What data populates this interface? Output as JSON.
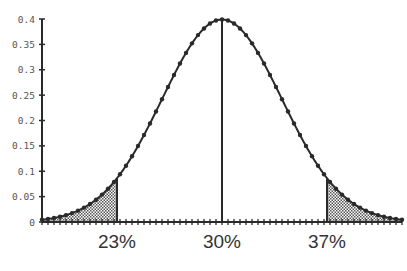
{
  "chart_data": {
    "type": "line",
    "title": "",
    "xlabel": "",
    "ylabel": "",
    "distribution": {
      "mean": 30,
      "sd": 4
    },
    "xlim": [
      18,
      42
    ],
    "ylim": [
      0,
      0.4
    ],
    "yticks": [
      0,
      0.05,
      0.1,
      0.15,
      0.2,
      0.25,
      0.3,
      0.35,
      0.4
    ],
    "ytick_labels": [
      "0",
      "0.05",
      "0.1",
      "0.15",
      "0.2",
      "0.25",
      "0.3",
      "0.35",
      "0.4"
    ],
    "xtick_step": 0.4,
    "xlabels": [
      {
        "x": 23,
        "label": "23%"
      },
      {
        "x": 30,
        "label": "30%"
      },
      {
        "x": 37,
        "label": "37%"
      }
    ],
    "marker_step": 0.4,
    "vertical_lines": [
      23,
      30,
      37
    ],
    "shaded_regions": [
      {
        "from": 18,
        "to": 23,
        "pattern": "dotted"
      },
      {
        "from": 37,
        "to": 42,
        "pattern": "dotted"
      }
    ],
    "sample_points": [
      {
        "x": 18,
        "y": 0.004
      },
      {
        "x": 20,
        "y": 0.018
      },
      {
        "x": 22,
        "y": 0.054
      },
      {
        "x": 23,
        "y": 0.086
      },
      {
        "x": 24,
        "y": 0.13
      },
      {
        "x": 26,
        "y": 0.242
      },
      {
        "x": 28,
        "y": 0.352
      },
      {
        "x": 30,
        "y": 0.399
      },
      {
        "x": 32,
        "y": 0.352
      },
      {
        "x": 34,
        "y": 0.242
      },
      {
        "x": 36,
        "y": 0.13
      },
      {
        "x": 37,
        "y": 0.086
      },
      {
        "x": 38,
        "y": 0.054
      },
      {
        "x": 40,
        "y": 0.018
      },
      {
        "x": 42,
        "y": 0.004
      }
    ]
  },
  "colors": {
    "line": "#2a2a2a",
    "axis": "#2a2a2a",
    "shade": "#888888"
  }
}
